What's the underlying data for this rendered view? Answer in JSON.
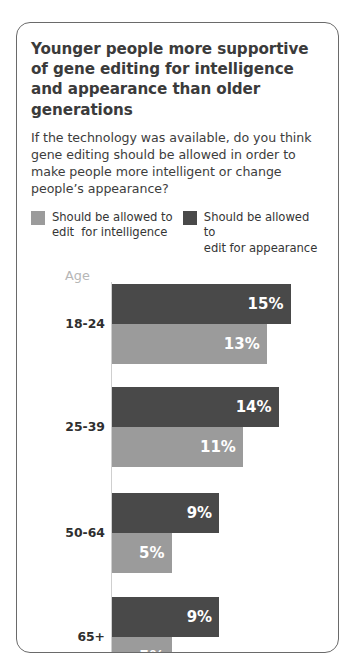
{
  "card": {
    "title": "Younger people more supportive of gene editing for intelligence and appearance than older generations",
    "subtitle": "If the technology was available, do you think gene editing should be allowed in order to make people more intelligent or change people’s appearance?",
    "age_caption": "Age"
  },
  "legend": [
    {
      "label": "Should be allowed to\nedit  for intelligence",
      "color": "#9b9b9b"
    },
    {
      "label": "Should be allowed to\nedit for appearance",
      "color": "#494949"
    }
  ],
  "chart_data": {
    "type": "bar",
    "orientation": "horizontal",
    "title": "Younger people more supportive of gene editing for intelligence and appearance than older generations",
    "subtitle": "If the technology was available, do you think gene editing should be allowed in order to make people more intelligent or change people’s appearance?",
    "xlabel": "",
    "ylabel": "Age",
    "categories": [
      "18-24",
      "25-39",
      "50-64",
      "65+"
    ],
    "series": [
      {
        "name": "Should be allowed to edit for appearance",
        "color": "#494949",
        "values": [
          15,
          14,
          9,
          9
        ],
        "labels": [
          "15%",
          "14%",
          "9%",
          "9%"
        ]
      },
      {
        "name": "Should be allowed to edit  for intelligence",
        "color": "#9b9b9b",
        "values": [
          13,
          11,
          5,
          5
        ],
        "labels": [
          "13%",
          "11%",
          "5%",
          "5%"
        ]
      }
    ],
    "xlim": [
      0,
      15
    ],
    "grid": false,
    "legend_position": "top"
  }
}
